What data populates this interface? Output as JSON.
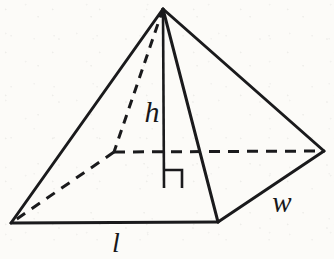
{
  "figure": {
    "shape_name": "rectangular-pyramid",
    "ink_color": "#1a1a1c",
    "background_color": "#fcfbf8",
    "canvas": {
      "width": 334,
      "height": 259
    },
    "labels": {
      "height": "h",
      "length": "l",
      "width": "w"
    },
    "label_positions": {
      "height": {
        "x": 152,
        "y": 122
      },
      "length": {
        "x": 116,
        "y": 251
      },
      "width": {
        "x": 282,
        "y": 211
      }
    },
    "vertices": {
      "apex": {
        "x": 163,
        "y": 9,
        "name": "apex"
      },
      "front_left": {
        "x": 11,
        "y": 223,
        "name": "base-front-left-corner"
      },
      "front_right": {
        "x": 218,
        "y": 222,
        "name": "base-front-right-corner"
      },
      "right": {
        "x": 324,
        "y": 151,
        "name": "base-right-corner"
      },
      "back": {
        "x": 114,
        "y": 152,
        "name": "base-back-corner-hidden"
      },
      "base_center": {
        "x": 164,
        "y": 188,
        "name": "base-center-foot-of-height"
      }
    },
    "edges": {
      "solid": [
        {
          "name": "edge-apex-to-front-left",
          "x1": 163,
          "y1": 9,
          "x2": 11,
          "y2": 223
        },
        {
          "name": "edge-apex-to-front-right",
          "x1": 163,
          "y1": 9,
          "x2": 218,
          "y2": 222
        },
        {
          "name": "edge-apex-to-right",
          "x1": 163,
          "y1": 9,
          "x2": 324,
          "y2": 151
        },
        {
          "name": "edge-base-front",
          "x1": 11,
          "y1": 223,
          "x2": 218,
          "y2": 222
        },
        {
          "name": "edge-base-right-front",
          "x1": 218,
          "y1": 222,
          "x2": 324,
          "y2": 151
        }
      ],
      "dashed": [
        {
          "name": "edge-apex-to-back-hidden",
          "x1": 163,
          "y1": 9,
          "x2": 114,
          "y2": 152
        },
        {
          "name": "edge-base-back-left-hidden",
          "x1": 114,
          "y1": 152,
          "x2": 11,
          "y2": 223
        },
        {
          "name": "edge-base-back-right-hidden",
          "x1": 114,
          "y1": 152,
          "x2": 324,
          "y2": 151
        }
      ]
    },
    "height_segment": {
      "name": "height-altitude-line",
      "x1": 163,
      "y1": 9,
      "x2": 164,
      "y2": 188
    },
    "right_angle_marker": {
      "name": "right-angle-square",
      "points": "164,170 182,170 182,188"
    }
  }
}
